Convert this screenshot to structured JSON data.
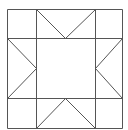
{
  "diagram": {
    "type": "quilt-block",
    "name": "sawtooth star",
    "stroke_color": "#555555",
    "background": "#ffffff",
    "grid": {
      "x": [
        7,
        36,
        95,
        122
      ],
      "y": [
        9,
        38,
        98,
        128
      ]
    },
    "lines": [
      {
        "id": "outer-top",
        "x1": 7,
        "y1": 9,
        "x2": 122,
        "y2": 9
      },
      {
        "id": "outer-bottom",
        "x1": 7,
        "y1": 128,
        "x2": 122,
        "y2": 128
      },
      {
        "id": "outer-left",
        "x1": 7,
        "y1": 9,
        "x2": 7,
        "y2": 128
      },
      {
        "id": "outer-right",
        "x1": 122,
        "y1": 9,
        "x2": 122,
        "y2": 128
      },
      {
        "id": "grid-v1",
        "x1": 36,
        "y1": 9,
        "x2": 36,
        "y2": 128
      },
      {
        "id": "grid-v2",
        "x1": 95,
        "y1": 9,
        "x2": 95,
        "y2": 128
      },
      {
        "id": "grid-h1",
        "x1": 7,
        "y1": 38,
        "x2": 122,
        "y2": 38
      },
      {
        "id": "grid-h2",
        "x1": 7,
        "y1": 98,
        "x2": 122,
        "y2": 98
      },
      {
        "id": "top-point-left",
        "x1": 36,
        "y1": 9,
        "x2": 65,
        "y2": 38
      },
      {
        "id": "top-point-right",
        "x1": 95,
        "y1": 9,
        "x2": 65,
        "y2": 38
      },
      {
        "id": "left-point-top",
        "x1": 7,
        "y1": 38,
        "x2": 36,
        "y2": 68
      },
      {
        "id": "left-point-bottom",
        "x1": 7,
        "y1": 98,
        "x2": 36,
        "y2": 68
      },
      {
        "id": "right-point-top",
        "x1": 122,
        "y1": 38,
        "x2": 95,
        "y2": 68
      },
      {
        "id": "right-point-bottom",
        "x1": 122,
        "y1": 98,
        "x2": 95,
        "y2": 68
      },
      {
        "id": "bottom-point-left",
        "x1": 36,
        "y1": 128,
        "x2": 65,
        "y2": 98
      },
      {
        "id": "bottom-point-right",
        "x1": 95,
        "y1": 128,
        "x2": 65,
        "y2": 98
      }
    ]
  }
}
